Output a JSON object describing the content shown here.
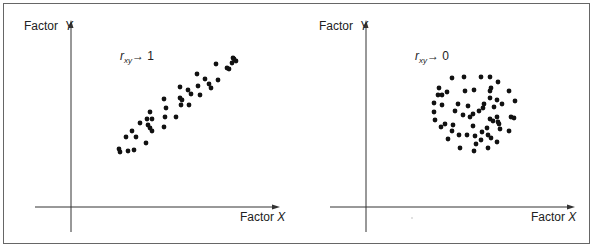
{
  "figure": {
    "panels": [
      {
        "id": "high-correlation",
        "y_axis_label": "Factor",
        "y_axis_var": "Y",
        "x_axis_label": "Factor",
        "x_axis_var": "X",
        "corr_symbol": "r",
        "corr_subscript": "xy",
        "corr_arrow": "→",
        "corr_value": "1"
      },
      {
        "id": "no-correlation",
        "y_axis_label": "Factor",
        "y_axis_var": "Y",
        "x_axis_label": "Factor",
        "x_axis_var": "X",
        "corr_symbol": "r",
        "corr_subscript": "xy",
        "corr_arrow": "→",
        "corr_value": "0"
      }
    ],
    "colors": {
      "dot": "#111111",
      "axis": "#333333",
      "frame": "#666666"
    }
  },
  "chart_data": [
    {
      "type": "scatter",
      "title": "r_xy → 1",
      "xlabel": "Factor X",
      "ylabel": "Factor Y",
      "grid": false,
      "ticks": "none",
      "points_px": [
        [
          120,
          152
        ],
        [
          119,
          149
        ],
        [
          128,
          151
        ],
        [
          134,
          150
        ],
        [
          126,
          137
        ],
        [
          132,
          131
        ],
        [
          136,
          137
        ],
        [
          146,
          143
        ],
        [
          140,
          123
        ],
        [
          147,
          119
        ],
        [
          150,
          112
        ],
        [
          152,
          119
        ],
        [
          148,
          125
        ],
        [
          150,
          128
        ],
        [
          152,
          131
        ],
        [
          164,
          99
        ],
        [
          166,
          108
        ],
        [
          165,
          117
        ],
        [
          164,
          127
        ],
        [
          176,
          117
        ],
        [
          180,
          87
        ],
        [
          180,
          98
        ],
        [
          182,
          100
        ],
        [
          181,
          105
        ],
        [
          189,
          105
        ],
        [
          188,
          90
        ],
        [
          191,
          94
        ],
        [
          197,
          74
        ],
        [
          198,
          86
        ],
        [
          200,
          95
        ],
        [
          205,
          79
        ],
        [
          209,
          84
        ],
        [
          211,
          88
        ],
        [
          216,
          64
        ],
        [
          218,
          80
        ],
        [
          227,
          68
        ],
        [
          229,
          69
        ],
        [
          232,
          63
        ],
        [
          233,
          58
        ],
        [
          236,
          61
        ],
        [
          234,
          59
        ]
      ]
    },
    {
      "type": "scatter",
      "title": "r_xy → 0",
      "xlabel": "Factor X",
      "ylabel": "Factor Y",
      "grid": false,
      "ticks": "none",
      "points_px": [
        [
          452,
          78
        ],
        [
          464,
          77
        ],
        [
          481,
          77
        ],
        [
          490,
          77
        ],
        [
          498,
          82
        ],
        [
          439,
          88
        ],
        [
          438,
          95
        ],
        [
          442,
          95
        ],
        [
          447,
          92
        ],
        [
          465,
          91
        ],
        [
          474,
          90
        ],
        [
          491,
          88
        ],
        [
          490,
          91
        ],
        [
          509,
          91
        ],
        [
          434,
          103
        ],
        [
          442,
          105
        ],
        [
          458,
          104
        ],
        [
          468,
          106
        ],
        [
          484,
          104
        ],
        [
          490,
          98
        ],
        [
          497,
          100
        ],
        [
          502,
          104
        ],
        [
          494,
          107
        ],
        [
          515,
          101
        ],
        [
          434,
          112
        ],
        [
          455,
          111
        ],
        [
          463,
          115
        ],
        [
          470,
          117
        ],
        [
          473,
          114
        ],
        [
          479,
          111
        ],
        [
          483,
          108
        ],
        [
          435,
          120
        ],
        [
          441,
          127
        ],
        [
          445,
          124
        ],
        [
          453,
          125
        ],
        [
          452,
          131
        ],
        [
          473,
          126
        ],
        [
          490,
          119
        ],
        [
          493,
          121
        ],
        [
          497,
          117
        ],
        [
          498,
          122
        ],
        [
          499,
          124
        ],
        [
          500,
          129
        ],
        [
          487,
          128
        ],
        [
          482,
          132
        ],
        [
          509,
          131
        ],
        [
          511,
          117
        ],
        [
          514,
          118
        ],
        [
          448,
          139
        ],
        [
          459,
          135
        ],
        [
          467,
          135
        ],
        [
          475,
          136
        ],
        [
          481,
          140
        ],
        [
          488,
          135
        ],
        [
          491,
          138
        ],
        [
          476,
          144
        ],
        [
          497,
          142
        ],
        [
          460,
          148
        ],
        [
          474,
          151
        ],
        [
          488,
          148
        ]
      ]
    }
  ]
}
